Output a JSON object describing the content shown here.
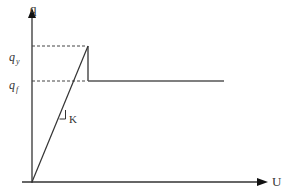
{
  "diagram": {
    "type": "force-displacement (elastic-perfectly-plastic with softening drop)",
    "axes": {
      "y_label": "q",
      "x_label": "U"
    },
    "levels": [
      {
        "symbol": "q",
        "subscript": "y",
        "meaning": "yield level"
      },
      {
        "symbol": "q",
        "subscript": "f",
        "meaning": "residual level"
      }
    ],
    "slope_label": "K",
    "colors": {
      "line": "#333333",
      "dashed": "#444444",
      "background": "#ffffff"
    }
  }
}
